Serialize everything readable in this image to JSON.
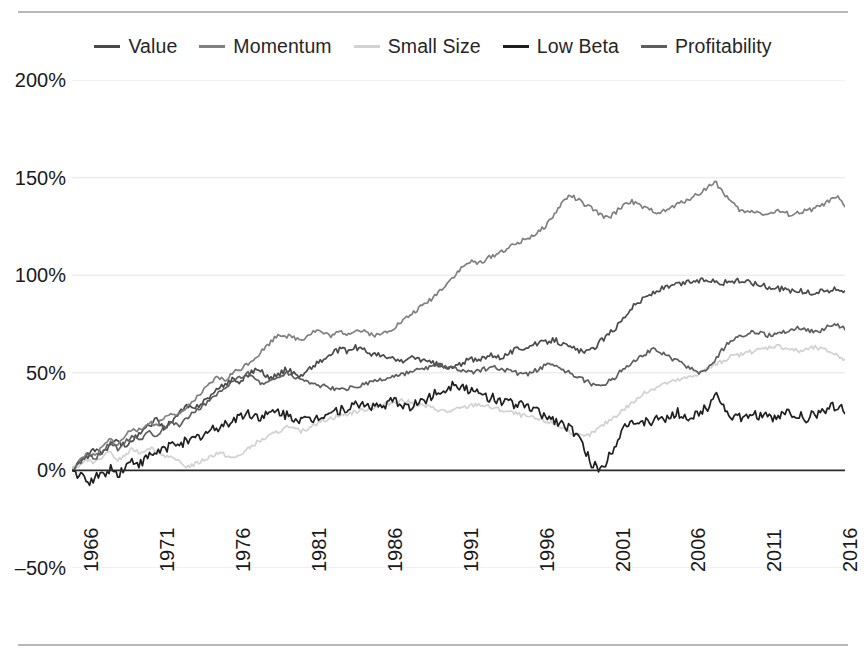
{
  "chart_data": {
    "type": "line",
    "title": "",
    "subtitle": "",
    "xlabel": "",
    "ylabel": "",
    "xlim": [
      1966,
      2016.9
    ],
    "ylim": [
      -50,
      200
    ],
    "grid": "horizontal",
    "legend_position": "top-center",
    "y_ticks": [
      "200%",
      "150%",
      "100%",
      "50%",
      "0%",
      "–50%"
    ],
    "y_tick_values": [
      200,
      150,
      100,
      50,
      0,
      -50
    ],
    "x_ticks": [
      "1966",
      "1971",
      "1976",
      "1981",
      "1986",
      "1991",
      "1996",
      "2001",
      "2006",
      "2011",
      "2016"
    ],
    "x_tick_values": [
      1966,
      1971,
      1976,
      1981,
      1986,
      1991,
      1996,
      2001,
      2006,
      2011,
      2016
    ],
    "x": [
      1966.0,
      1966.5,
      1967.0,
      1967.5,
      1968.0,
      1968.5,
      1969.0,
      1969.5,
      1970.0,
      1970.5,
      1971.0,
      1971.5,
      1972.0,
      1972.5,
      1973.0,
      1973.5,
      1974.0,
      1974.5,
      1975.0,
      1975.5,
      1976.0,
      1976.5,
      1977.0,
      1977.5,
      1978.0,
      1978.5,
      1979.0,
      1979.5,
      1980.0,
      1980.5,
      1981.0,
      1981.5,
      1982.0,
      1982.5,
      1983.0,
      1983.5,
      1984.0,
      1984.5,
      1985.0,
      1985.5,
      1986.0,
      1986.5,
      1987.0,
      1987.5,
      1988.0,
      1988.5,
      1989.0,
      1989.5,
      1990.0,
      1990.5,
      1991.0,
      1991.5,
      1992.0,
      1992.5,
      1993.0,
      1993.5,
      1994.0,
      1994.5,
      1995.0,
      1995.5,
      1996.0,
      1996.5,
      1997.0,
      1997.5,
      1998.0,
      1998.5,
      1999.0,
      1999.5,
      2000.0,
      2000.5,
      2001.0,
      2001.5,
      2002.0,
      2002.5,
      2003.0,
      2003.5,
      2004.0,
      2004.5,
      2005.0,
      2005.5,
      2006.0,
      2006.5,
      2007.0,
      2007.5,
      2008.0,
      2008.5,
      2009.0,
      2009.5,
      2010.0,
      2010.5,
      2011.0,
      2011.5,
      2012.0,
      2012.5,
      2013.0,
      2013.5,
      2014.0,
      2014.5,
      2015.0,
      2015.5,
      2016.0,
      2016.8
    ],
    "series": [
      {
        "name": "Value",
        "color": "#4a4a4a",
        "values": [
          0,
          4,
          7,
          11,
          9,
          13,
          15,
          12,
          16,
          19,
          23,
          26,
          22,
          25,
          29,
          33,
          31,
          35,
          38,
          41,
          44,
          47,
          45,
          49,
          52,
          50,
          47,
          49,
          52,
          50,
          48,
          52,
          55,
          57,
          60,
          62,
          61,
          63,
          62,
          60,
          59,
          58,
          57,
          56,
          57,
          58,
          56,
          55,
          54,
          52,
          53,
          55,
          57,
          56,
          58,
          59,
          58,
          60,
          62,
          63,
          64,
          65,
          66,
          67,
          65,
          63,
          62,
          60,
          62,
          66,
          69,
          73,
          78,
          83,
          86,
          89,
          91,
          93,
          94,
          95,
          96,
          97,
          97,
          98,
          97,
          96,
          97,
          97,
          97,
          96,
          95,
          94,
          93,
          93,
          92,
          92,
          91,
          91,
          92,
          92,
          93,
          92
        ]
      },
      {
        "name": "Momentum",
        "color": "#808080",
        "values": [
          0,
          5,
          9,
          7,
          12,
          16,
          13,
          18,
          22,
          20,
          25,
          23,
          27,
          30,
          28,
          32,
          36,
          40,
          44,
          48,
          46,
          50,
          52,
          55,
          58,
          62,
          66,
          70,
          69,
          68,
          67,
          70,
          72,
          70,
          69,
          71,
          70,
          72,
          71,
          70,
          69,
          71,
          73,
          76,
          79,
          82,
          85,
          88,
          92,
          96,
          100,
          104,
          107,
          106,
          108,
          110,
          112,
          114,
          116,
          118,
          120,
          122,
          126,
          131,
          137,
          141,
          139,
          136,
          134,
          131,
          129,
          132,
          136,
          138,
          136,
          134,
          133,
          132,
          134,
          136,
          138,
          140,
          142,
          145,
          148,
          143,
          138,
          134,
          132,
          133,
          132,
          131,
          133,
          132,
          131,
          132,
          133,
          134,
          136,
          138,
          140,
          135
        ]
      },
      {
        "name": "Small Size",
        "color": "#d2d2d2",
        "values": [
          0,
          3,
          6,
          4,
          7,
          9,
          5,
          8,
          11,
          9,
          12,
          10,
          8,
          6,
          4,
          2,
          3,
          5,
          7,
          9,
          8,
          6,
          8,
          11,
          14,
          16,
          18,
          20,
          22,
          21,
          20,
          22,
          24,
          26,
          27,
          28,
          29,
          30,
          31,
          32,
          33,
          34,
          35,
          36,
          35,
          34,
          33,
          32,
          31,
          30,
          31,
          32,
          33,
          34,
          33,
          32,
          31,
          30,
          29,
          28,
          27,
          26,
          25,
          24,
          22,
          20,
          18,
          17,
          19,
          22,
          25,
          28,
          31,
          34,
          37,
          40,
          42,
          44,
          45,
          46,
          47,
          48,
          50,
          52,
          54,
          56,
          58,
          59,
          60,
          61,
          62,
          63,
          64,
          63,
          62,
          61,
          62,
          63,
          62,
          61,
          59,
          57
        ]
      },
      {
        "name": "Low Beta",
        "color": "#1f1f1f",
        "values": [
          0,
          -3,
          -6,
          -4,
          -2,
          1,
          -2,
          2,
          5,
          3,
          7,
          9,
          11,
          13,
          15,
          14,
          16,
          18,
          20,
          22,
          24,
          26,
          28,
          29,
          28,
          27,
          29,
          30,
          28,
          27,
          26,
          25,
          27,
          29,
          30,
          31,
          32,
          33,
          34,
          33,
          32,
          34,
          35,
          34,
          33,
          34,
          36,
          38,
          40,
          42,
          45,
          43,
          41,
          39,
          38,
          37,
          36,
          35,
          34,
          33,
          32,
          30,
          28,
          26,
          24,
          22,
          18,
          10,
          3,
          0,
          6,
          14,
          22,
          26,
          21,
          26,
          24,
          28,
          25,
          30,
          28,
          26,
          30,
          32,
          41,
          33,
          28,
          27,
          26,
          29,
          28,
          27,
          26,
          30,
          29,
          28,
          27,
          29,
          30,
          32,
          34,
          29
        ]
      },
      {
        "name": "Profitability",
        "color": "#5e5e5e",
        "values": [
          0,
          4,
          8,
          6,
          10,
          14,
          11,
          15,
          18,
          16,
          20,
          18,
          22,
          25,
          23,
          27,
          30,
          33,
          36,
          39,
          42,
          45,
          48,
          50,
          47,
          44,
          46,
          48,
          50,
          48,
          47,
          45,
          44,
          43,
          42,
          41,
          42,
          43,
          44,
          45,
          46,
          47,
          48,
          49,
          50,
          51,
          52,
          53,
          54,
          53,
          52,
          51,
          50,
          51,
          52,
          53,
          52,
          51,
          50,
          49,
          50,
          52,
          54,
          53,
          52,
          50,
          48,
          46,
          44,
          43,
          45,
          48,
          52,
          55,
          58,
          60,
          62,
          60,
          58,
          56,
          54,
          52,
          50,
          52,
          56,
          62,
          66,
          68,
          70,
          71,
          70,
          69,
          70,
          71,
          72,
          73,
          72,
          71,
          72,
          74,
          75,
          72
        ]
      }
    ]
  },
  "legend": {
    "items": [
      {
        "label": "Value",
        "color": "#4a4a4a"
      },
      {
        "label": "Momentum",
        "color": "#808080"
      },
      {
        "label": "Small Size",
        "color": "#d2d2d2"
      },
      {
        "label": "Low Beta",
        "color": "#1f1f1f"
      },
      {
        "label": "Profitability",
        "color": "#5e5e5e"
      }
    ]
  },
  "colors": {
    "background": "#ffffff",
    "gridline": "#ededed",
    "zero_line": "#2a2a2a",
    "rule": "#b9b9b9",
    "text": "#1a1a1a"
  }
}
